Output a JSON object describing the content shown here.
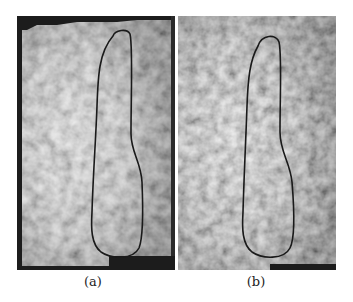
{
  "figure": {
    "panels": [
      {
        "id": "a",
        "caption": "(a)",
        "description": "grayscale ultrasound texture with dark masked border regions and overlaid contour",
        "contour_color": "#1a1a1a"
      },
      {
        "id": "b",
        "caption": "(b)",
        "description": "grayscale ultrasound texture with overlaid contour",
        "contour_color": "#1a1a1a"
      }
    ]
  }
}
